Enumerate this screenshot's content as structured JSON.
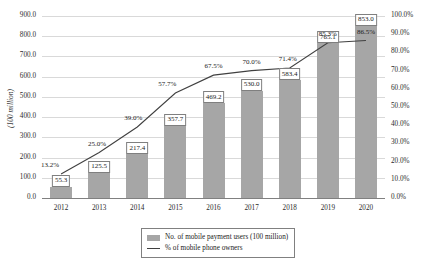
{
  "chart_data": {
    "type": "bar",
    "title": "",
    "subtitle": "",
    "xlabel": "",
    "ylabel": "(100 million)",
    "y2label": "",
    "grid": true,
    "legend_position": "bottom-center",
    "categories": [
      "2012",
      "2013",
      "2014",
      "2015",
      "2016",
      "2017",
      "2018",
      "2019",
      "2020"
    ],
    "ylim": [
      0,
      900
    ],
    "y2lim": [
      0,
      100
    ],
    "yticks": [
      "0.0",
      "100.0",
      "200.0",
      "300.0",
      "400.0",
      "500.0",
      "600.0",
      "700.0",
      "800.0",
      "900.0"
    ],
    "y2ticks": [
      "0.0%",
      "10.0%",
      "20.0%",
      "30.0%",
      "40.0%",
      "50.0%",
      "60.0%",
      "70.0%",
      "80.0%",
      "90.0%",
      "100.0%"
    ],
    "series": [
      {
        "name": "No. of mobile payment users (100 million)",
        "kind": "bar",
        "axis": "left",
        "color": "#a6a6a6",
        "values": [
          55.3,
          125.5,
          217.4,
          357.7,
          469.2,
          530.0,
          583.4,
          765.1,
          853.0
        ],
        "labels": [
          "55.3",
          "125.5",
          "217.4",
          "357.7",
          "469.2",
          "530.0",
          "583.4",
          "765.1",
          "853.0"
        ]
      },
      {
        "name": "% of mobile phone owners",
        "kind": "line",
        "axis": "right",
        "color": "#404040",
        "values": [
          13.2,
          25.0,
          39.0,
          57.7,
          67.5,
          70.0,
          71.4,
          85.3,
          86.5
        ],
        "labels": [
          "13.2%",
          "25.0%",
          "39.0%",
          "57.7%",
          "67.5%",
          "70.0%",
          "71.4%",
          "85.3%",
          "86.5%"
        ]
      }
    ]
  },
  "legend": {
    "items": [
      {
        "label": "No. of mobile payment users (100 million)",
        "marker": "bar-swatch"
      },
      {
        "label": "% of mobile phone owners",
        "marker": "line-swatch"
      }
    ]
  }
}
